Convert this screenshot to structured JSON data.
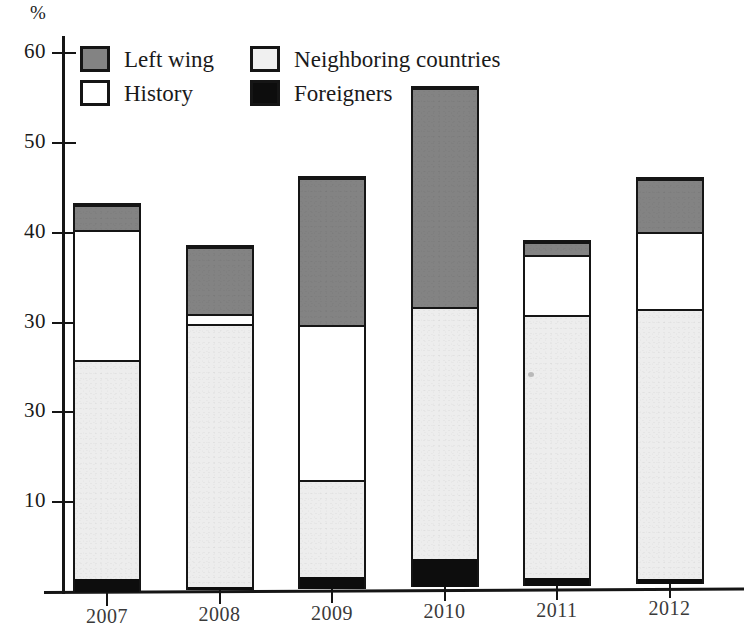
{
  "chart_data": {
    "type": "bar",
    "subtype": "stacked",
    "title": "",
    "xlabel": "",
    "ylabel": "%",
    "ylim": [
      0,
      62
    ],
    "grid": false,
    "legend_position": "top-left",
    "y_tick_labels": [
      "60",
      "50",
      "40",
      "30",
      "30",
      "10"
    ],
    "y_tick_values": [
      60,
      50,
      40,
      30,
      20,
      10
    ],
    "categories": [
      "2007",
      "2008",
      "2009",
      "2010",
      "2011",
      "2012"
    ],
    "series": [
      {
        "name": "Foreigners",
        "color": "#0d0d0d",
        "values": [
          1.5,
          0.4,
          1.3,
          3.2,
          0.8,
          0.6
        ]
      },
      {
        "name": "Neighboring countries",
        "color": "#ededed",
        "values": [
          24.5,
          29.4,
          10.9,
          28.1,
          29.5,
          30.2
        ]
      },
      {
        "name": "History",
        "color": "#ffffff",
        "values": [
          14.5,
          1.2,
          17.3,
          0.0,
          6.7,
          8.6
        ]
      },
      {
        "name": "Left wing",
        "color": "#838383",
        "values": [
          2.8,
          7.4,
          16.5,
          24.5,
          1.5,
          5.9
        ]
      }
    ],
    "totals": [
      43.3,
      38.4,
      46.0,
      55.8,
      38.5,
      45.3
    ]
  },
  "axis": {
    "unit_label": "%"
  },
  "legend": {
    "items": [
      {
        "key": "left-wing",
        "label": "Left wing",
        "color": "#838383"
      },
      {
        "key": "neighboring-countries",
        "label": "Neighboring countries",
        "color": "#f0f0f0"
      },
      {
        "key": "history",
        "label": "History",
        "color": "#ffffff"
      },
      {
        "key": "foreigners",
        "label": "Foreigners",
        "color": "#0d0d0d"
      }
    ]
  }
}
